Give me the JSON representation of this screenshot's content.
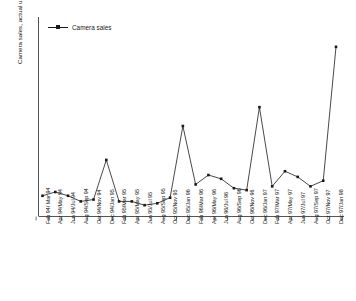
{
  "chart_data": {
    "type": "line",
    "title": "",
    "xlabel": "",
    "ylabel": "Camera sales, actual units confidential",
    "legend": [
      "Camera sales"
    ],
    "legend_position": "top-left",
    "grid": false,
    "y_tick_labels": [],
    "ylim": [
      0,
      100
    ],
    "note": "Y axis values are not printed on the chart; units are confidential. Values below are read off pixel heights on a relative 0-100 scale.",
    "categories": [
      "Feb 94/ Mar 94",
      "Apr 94/May 94",
      "Jun 94/Jul 94",
      "Aug 94/Sep 94",
      "Oct 94/Nov 94",
      "Dec 94/Jan 95",
      "Feb 95/Mar 95",
      "Apr 95/May 95",
      "Jun 95/Jul 95",
      "Aug 95/Sep 95",
      "Oct 95/Nov 95",
      "Dec 95/Jan 96",
      "Feb 96/Mar 96",
      "Apr 96/May 96",
      "Jun 96/Jul 96",
      "Aug 96/Sep 96",
      "Oct 96/Nov 96",
      "Dec 96/Jan 97",
      "Feb 97/Mar 97",
      "Apr 97/May 97",
      "Jun 97/Jul 97",
      "Aug 97/Sep 97",
      "Oct 97/Nov 97",
      "Dec 97/Jan 98"
    ],
    "series": [
      {
        "name": "Camera sales",
        "color": "#1a1a1a",
        "marker": "square",
        "values": [
          11,
          13,
          11,
          8,
          9,
          30,
          8,
          8,
          6,
          7,
          10,
          48,
          17,
          22,
          20,
          15,
          14,
          58,
          16,
          24,
          21,
          16,
          19,
          90
        ]
      }
    ]
  },
  "legend": {
    "label": "Camera sales"
  },
  "axis": {
    "y_title": "Camera sales, actual units confidential"
  }
}
